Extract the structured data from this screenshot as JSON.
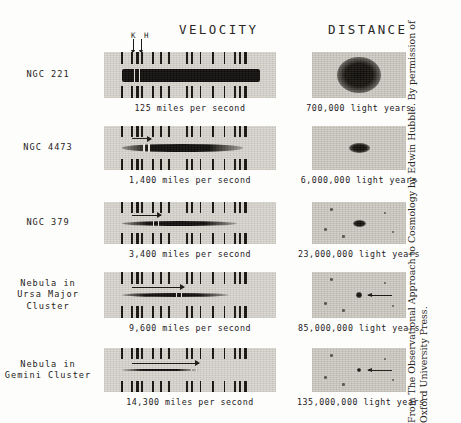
{
  "figure": {
    "columns": {
      "velocity_header": "VELOCITY",
      "distance_header": "DISTANCE"
    },
    "spectral_line_markers": {
      "k_label": "K",
      "h_label": "H",
      "combined": "K H"
    },
    "credit_line_1": "From The Observational Approach to Cosmology by Edwin Hubble. By permission of",
    "credit_line_2": "Oxford University Press."
  },
  "rows": [
    {
      "label": "NGC 221",
      "velocity_caption": "125 miles per second",
      "distance_caption": "700,000 light years",
      "velocity_mps": 125,
      "distance_ly": 700000,
      "redshift_fraction": 0.02,
      "galaxy_size": "large"
    },
    {
      "label": "NGC 4473",
      "velocity_caption": "1,400 miles per second",
      "distance_caption": "6,000,000 light years",
      "velocity_mps": 1400,
      "distance_ly": 6000000,
      "redshift_fraction": 0.12,
      "galaxy_size": "medium"
    },
    {
      "label": "NGC 379",
      "velocity_caption": "3,400 miles per second",
      "distance_caption": "23,000,000 light years",
      "velocity_mps": 3400,
      "distance_ly": 23000000,
      "redshift_fraction": 0.22,
      "galaxy_size": "small"
    },
    {
      "label": "Nebula in\nUrsa Major\nCluster",
      "velocity_caption": "9,600 miles per second",
      "distance_caption": "85,000,000 light years",
      "velocity_mps": 9600,
      "distance_ly": 85000000,
      "redshift_fraction": 0.46,
      "galaxy_size": "tiny"
    },
    {
      "label": "Nebula in\nGemini Cluster",
      "velocity_caption": "14,300 miles per second",
      "distance_caption": "135,000,000 light years",
      "velocity_mps": 14300,
      "distance_ly": 135000000,
      "redshift_fraction": 0.62,
      "galaxy_size": "point"
    }
  ],
  "chart_data": {
    "type": "table",
    "columns": [
      "Nebula",
      "Velocity",
      "Distance"
    ],
    "categories": [
      "NGC 221",
      "NGC 4473",
      "NGC 379",
      "Nebula in Ursa Major Cluster",
      "Nebula in Gemini Cluster"
    ],
    "series": [
      {
        "name": "Velocity (miles per second)",
        "values": [
          125,
          1400,
          3400,
          9600,
          14300
        ]
      },
      {
        "name": "Distance (light years)",
        "values": [
          700000,
          6000000,
          23000000,
          85000000,
          135000000
        ]
      }
    ],
    "xlabel": "Distance (light years)",
    "ylabel": "Velocity (miles per second)",
    "annotations": [
      "K",
      "H",
      "VELOCITY",
      "DISTANCE"
    ],
    "grid": false,
    "legend": "none"
  },
  "geometry": {
    "row_tops": [
      52,
      126,
      202,
      272,
      348
    ],
    "panel_heights": [
      46,
      44,
      42,
      46,
      44
    ],
    "comparison_line_positions": [
      0.02,
      0.075,
      0.105,
      0.135,
      0.2,
      0.245,
      0.29,
      0.395,
      0.425,
      0.475,
      0.545,
      0.615,
      0.675,
      0.705,
      0.735
    ]
  }
}
